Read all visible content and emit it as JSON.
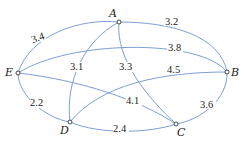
{
  "graph": {
    "nodes": [
      {
        "id": "A",
        "label": "A",
        "x": 119,
        "y": 22
      },
      {
        "id": "B",
        "label": "B",
        "x": 227,
        "y": 72
      },
      {
        "id": "C",
        "label": "C",
        "x": 176,
        "y": 124
      },
      {
        "id": "D",
        "label": "D",
        "x": 70,
        "y": 122
      },
      {
        "id": "E",
        "label": "E",
        "x": 18,
        "y": 73
      }
    ],
    "edges": [
      {
        "from": "A",
        "to": "E",
        "weight": "3.4"
      },
      {
        "from": "A",
        "to": "B",
        "weight": "3.2"
      },
      {
        "from": "E",
        "to": "B",
        "weight": "3.8"
      },
      {
        "from": "A",
        "to": "D",
        "weight": "3.1"
      },
      {
        "from": "A",
        "to": "C",
        "weight": "3.3"
      },
      {
        "from": "D",
        "to": "B",
        "weight": "4.5"
      },
      {
        "from": "E",
        "to": "C",
        "weight": "4.1"
      },
      {
        "from": "E",
        "to": "D",
        "weight": "2.2"
      },
      {
        "from": "D",
        "to": "C",
        "weight": "2.4"
      },
      {
        "from": "B",
        "to": "C",
        "weight": "3.6"
      }
    ]
  },
  "labels": {
    "A": "A",
    "B": "B",
    "C": "C",
    "D": "D",
    "E": "E",
    "w_AE": "3.4",
    "w_AB": "3.2",
    "w_EB": "3.8",
    "w_AD": "3.1",
    "w_AC": "3.3",
    "w_DB": "4.5",
    "w_EC": "4.1",
    "w_ED": "2.2",
    "w_DC": "2.4",
    "w_BC": "3.6"
  },
  "colors": {
    "edge": "#7d9fd6",
    "node_stroke": "#333333",
    "text": "#222222"
  }
}
